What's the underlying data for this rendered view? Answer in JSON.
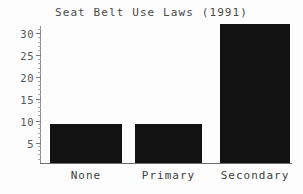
{
  "chart_data": {
    "type": "bar",
    "title": "Seat Belt Use Laws (1991)",
    "xlabel": "",
    "ylabel": "",
    "categories": [
      "None",
      "Primary",
      "Secondary"
    ],
    "values": [
      9,
      9,
      32
    ],
    "ylim": [
      0,
      33
    ],
    "yticks": [
      5,
      10,
      15,
      20,
      25,
      30
    ],
    "ytick_labels": [
      "5",
      "10",
      "15",
      "20",
      "25",
      "30"
    ],
    "minor_tick_interval": 1,
    "grid": false,
    "legend": false,
    "bar_color": "#121212",
    "axis_color": "#7c7c7c",
    "text_color": "#4a4a4a",
    "background": "#fdfdfd"
  },
  "axis": {
    "tick_0": "5",
    "tick_1": "10",
    "tick_2": "15",
    "tick_3": "20",
    "tick_4": "25",
    "tick_5": "30"
  },
  "categories": {
    "cat_0": "None",
    "cat_1": "Primary",
    "cat_2": "Secondary"
  }
}
